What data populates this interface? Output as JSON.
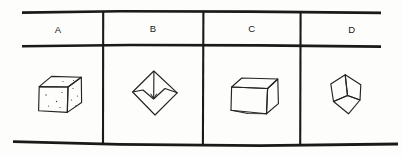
{
  "diagram": {
    "type": "answer-choice-table",
    "title": "",
    "canvas": {
      "width": 403,
      "height": 155,
      "background": "#fdfdfc"
    },
    "style": {
      "ink_color": "#1a1a1a",
      "figure_stroke": "#232323",
      "speckle_color": "#3a3a3a",
      "hand_drawn": true
    },
    "table": {
      "columns": 4,
      "rows": 2,
      "has_left_border": false,
      "has_right_border": false,
      "horizontal_rules": [
        {
          "name": "top-rule",
          "y_left": 11,
          "y_right": 13,
          "thickness": 2.6
        },
        {
          "name": "header-rule",
          "y_left": 45,
          "y_right": 47,
          "thickness": 2.6
        },
        {
          "name": "bottom-rule",
          "y_left": 141,
          "y_right": 146,
          "thickness": 2.6
        }
      ],
      "vertical_dividers": [
        {
          "name": "divider-1",
          "x": 103
        },
        {
          "name": "divider-2",
          "x": 203
        },
        {
          "name": "divider-3",
          "x": 300
        }
      ]
    },
    "header": {
      "row_label": "answer-choice-letters",
      "cells": [
        {
          "label": "A",
          "cx": 58,
          "cy": 32
        },
        {
          "label": "B",
          "cx": 153,
          "cy": 32
        },
        {
          "label": "C",
          "cx": 252,
          "cy": 32
        },
        {
          "label": "D",
          "cx": 352,
          "cy": 32
        }
      ]
    },
    "figures": [
      {
        "choice": "A",
        "name": "speckled-cube",
        "description": "Hand-drawn cube in three-quarter perspective with small dots speckled across the visible front and right faces",
        "faces_visible": 3,
        "has_speckles": true,
        "speckle_count": 11
      },
      {
        "choice": "B",
        "name": "notched-diamond",
        "description": "Rotated square (diamond) with an inner V-shaped notch cut from the upper edges and a vertical line from the top vertex to the notch apex",
        "faces_visible": 2,
        "has_speckles": false,
        "speckle_count": 0
      },
      {
        "choice": "C",
        "name": "plain-box",
        "description": "Hand-drawn rectangular box in perspective seen slightly from above, left face, front face and top face visible, no surface markings",
        "faces_visible": 3,
        "has_speckles": false,
        "speckle_count": 0
      },
      {
        "choice": "D",
        "name": "corner-view-cube",
        "description": "Cube seen straight down a corner vertex: three rhombus faces meeting at a central point",
        "faces_visible": 3,
        "has_speckles": false,
        "speckle_count": 0
      }
    ]
  }
}
